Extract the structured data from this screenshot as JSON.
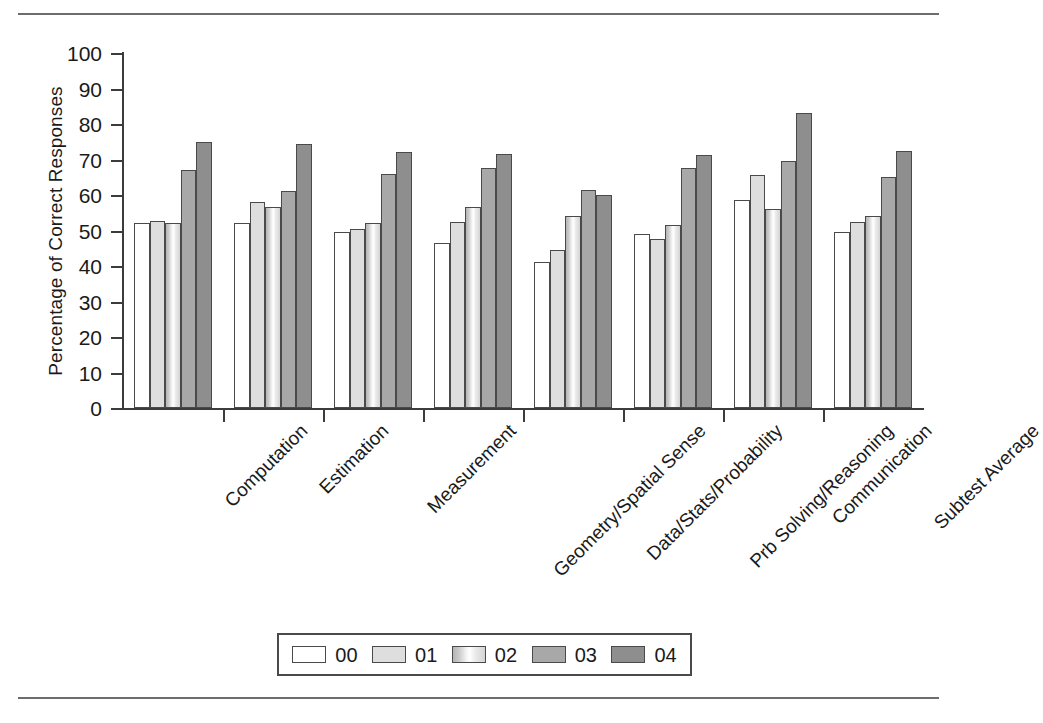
{
  "chart_data": {
    "type": "bar",
    "title": "",
    "subtitle": "",
    "xlabel": "",
    "ylabel": "Percentage of Correct Responses",
    "ylim": [
      0,
      100
    ],
    "ytick_step": 10,
    "yticks": [
      100,
      90,
      80,
      70,
      60,
      50,
      40,
      30,
      20,
      10,
      0
    ],
    "grid": false,
    "legend_position": "bottom",
    "categories": [
      "Computation",
      "Estimation",
      "Measurement",
      "Geometry/Spatial Sense",
      "Data/Stats/Probability",
      "Prb Solving/Reasoning",
      "Communication",
      "Subtest Average"
    ],
    "series": [
      {
        "name": "00",
        "color": "#ffffff",
        "values": [
          52.0,
          52.0,
          49.5,
          46.5,
          41.0,
          49.0,
          58.5,
          49.5
        ]
      },
      {
        "name": "01",
        "color": "#dedede",
        "values": [
          52.8,
          58.0,
          50.5,
          52.5,
          44.5,
          47.5,
          65.5,
          52.5
        ]
      },
      {
        "name": "02",
        "color": "#e8e8e8",
        "values": [
          52.0,
          56.5,
          52.0,
          56.5,
          54.0,
          51.5,
          56.0,
          54.0
        ]
      },
      {
        "name": "03",
        "color": "#a8a8a8",
        "values": [
          67.0,
          61.0,
          66.0,
          67.5,
          61.5,
          67.5,
          69.5,
          65.0
        ]
      },
      {
        "name": "04",
        "color": "#8e8e8e",
        "values": [
          74.8,
          74.5,
          72.0,
          71.5,
          60.0,
          71.2,
          83.0,
          72.3
        ]
      }
    ]
  },
  "legend": {
    "entries": [
      {
        "label": "00"
      },
      {
        "label": "01"
      },
      {
        "label": "02"
      },
      {
        "label": "03"
      },
      {
        "label": "04"
      }
    ]
  }
}
